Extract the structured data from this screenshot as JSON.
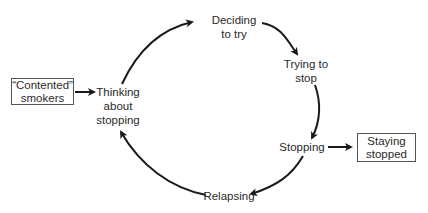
{
  "diagram": {
    "type": "cycle",
    "external_nodes": {
      "contented_smokers": {
        "line1": "“Contented”",
        "line2": "smokers"
      },
      "staying_stopped": {
        "line1": "Staying",
        "line2": "stopped"
      }
    },
    "cycle_nodes": {
      "thinking": {
        "line1": "Thinking",
        "line2": "about",
        "line3": "stopping"
      },
      "deciding": {
        "line1": "Deciding",
        "line2": "to try"
      },
      "trying": {
        "line1": "Trying to",
        "line2": "stop"
      },
      "stopping": {
        "line1": "Stopping"
      },
      "relapsing": {
        "line1": "Relapsing"
      }
    },
    "edges": [
      {
        "from": "“Contented” smokers",
        "to": "Thinking about stopping"
      },
      {
        "from": "Thinking about stopping",
        "to": "Deciding to try"
      },
      {
        "from": "Deciding to try",
        "to": "Trying to stop"
      },
      {
        "from": "Trying to stop",
        "to": "Stopping"
      },
      {
        "from": "Stopping",
        "to": "Staying stopped"
      },
      {
        "from": "Stopping",
        "to": "Relapsing"
      },
      {
        "from": "Relapsing",
        "to": "Thinking about stopping"
      }
    ],
    "colors": {
      "stroke": "#1a1a1a",
      "box_border": "#555555",
      "text": "#2a2a2a"
    }
  }
}
